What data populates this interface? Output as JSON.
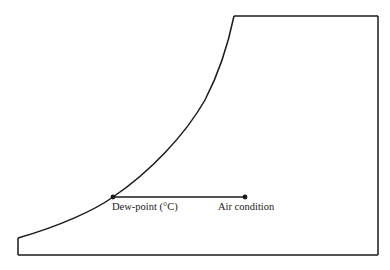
{
  "diagram": {
    "type": "psychrometric-sketch",
    "labels": {
      "dew_point": "Dew-point (°C)",
      "air_condition": "Air condition"
    },
    "colors": {
      "line": "#1a1a1a",
      "background": "#ffffff"
    },
    "points": {
      "dew_point": {
        "x": 113,
        "y": 197
      },
      "air_condition": {
        "x": 245,
        "y": 197
      }
    },
    "boundary": {
      "top_edge": {
        "x1": 234,
        "x2": 378,
        "y": 16
      },
      "right_edge": {
        "x": 378,
        "y1": 16,
        "y2": 255
      },
      "bottom_edge": {
        "x1": 18,
        "x2": 378,
        "y": 255
      },
      "left_edge": {
        "x": 18,
        "y1": 238,
        "y2": 255
      }
    }
  }
}
